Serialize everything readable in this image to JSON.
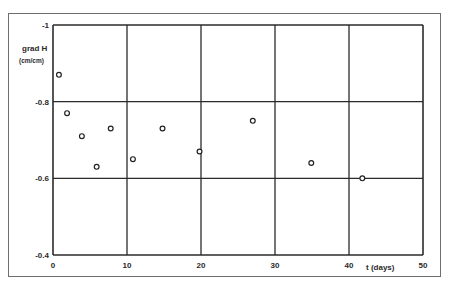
{
  "chart_data": {
    "type": "scatter",
    "title": "",
    "xlabel": "t (days)",
    "ylabel_line1": "grad H",
    "ylabel_line2": "(cm/cm)",
    "xlim": [
      0,
      50
    ],
    "ylim": [
      -0.4,
      -1
    ],
    "x_ticks": [
      0,
      10,
      20,
      30,
      40,
      50
    ],
    "x_tick_labels": [
      "0",
      "10",
      "20",
      "30",
      "40",
      "50"
    ],
    "y_ticks": [
      -1,
      -0.8,
      -0.6,
      -0.4
    ],
    "y_tick_labels": [
      "-1",
      "-0.8",
      "-0.6",
      "-0.4"
    ],
    "grid": true,
    "marker": "open-circle",
    "series": [
      {
        "name": "grad H",
        "x": [
          0.8,
          1.9,
          3.9,
          5.9,
          7.8,
          10.8,
          14.8,
          19.8,
          27.0,
          34.9,
          41.8
        ],
        "y": [
          -0.87,
          -0.77,
          -0.71,
          -0.63,
          -0.73,
          -0.65,
          -0.73,
          -0.67,
          -0.75,
          -0.64,
          -0.6
        ]
      }
    ]
  }
}
